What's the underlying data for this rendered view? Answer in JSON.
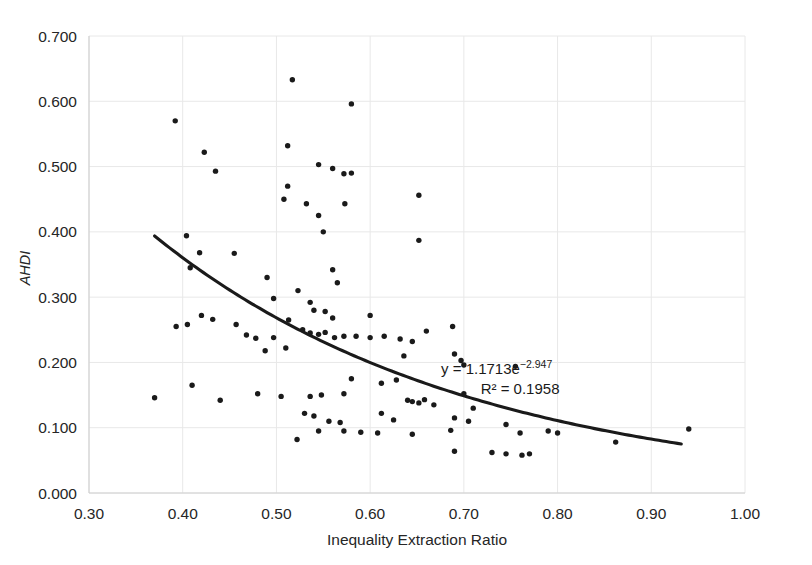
{
  "chart_data": {
    "type": "scatter",
    "title": "",
    "xlabel": "Inequality Extraction Ratio",
    "ylabel": "AHDI",
    "xlim": [
      0.3,
      1.0
    ],
    "ylim": [
      0.0,
      0.7
    ],
    "xticks": [
      "0.30",
      "0.40",
      "0.50",
      "0.60",
      "0.70",
      "0.80",
      "0.90",
      "1.00"
    ],
    "xtick_values": [
      0.3,
      0.4,
      0.5,
      0.6,
      0.7,
      0.8,
      0.9,
      1.0
    ],
    "yticks": [
      "0.000",
      "0.100",
      "0.200",
      "0.300",
      "0.400",
      "0.500",
      "0.600",
      "0.700"
    ],
    "ytick_values": [
      0.0,
      0.1,
      0.2,
      0.3,
      0.4,
      0.5,
      0.6,
      0.7
    ],
    "grid": true,
    "legend": "none",
    "marker": "filled-circle",
    "marker_color": "#1a1a1a",
    "marker_size": 5,
    "annotations": [
      {
        "text": "y = 1.1713e",
        "superscript": "−2.947",
        "x": 0.735,
        "y": 0.182
      },
      {
        "text": "R² = 0.1958",
        "superscript": "",
        "x": 0.76,
        "y": 0.152
      }
    ],
    "trendline": {
      "type": "exponential",
      "equation": "y = 1.1713e^(-2.947x)",
      "r_squared": 0.1958,
      "coefficient": 1.1713,
      "exponent": -2.947,
      "x_start": 0.37,
      "x_end": 0.932,
      "color": "#1a1a1a"
    },
    "points": [
      [
        0.392,
        0.57
      ],
      [
        0.517,
        0.633
      ],
      [
        0.58,
        0.596
      ],
      [
        0.423,
        0.522
      ],
      [
        0.435,
        0.493
      ],
      [
        0.512,
        0.532
      ],
      [
        0.545,
        0.503
      ],
      [
        0.56,
        0.497
      ],
      [
        0.572,
        0.489
      ],
      [
        0.58,
        0.49
      ],
      [
        0.512,
        0.47
      ],
      [
        0.508,
        0.45
      ],
      [
        0.532,
        0.443
      ],
      [
        0.573,
        0.443
      ],
      [
        0.545,
        0.425
      ],
      [
        0.652,
        0.456
      ],
      [
        0.55,
        0.4
      ],
      [
        0.652,
        0.387
      ],
      [
        0.404,
        0.394
      ],
      [
        0.418,
        0.368
      ],
      [
        0.455,
        0.367
      ],
      [
        0.408,
        0.345
      ],
      [
        0.56,
        0.342
      ],
      [
        0.565,
        0.322
      ],
      [
        0.49,
        0.33
      ],
      [
        0.523,
        0.31
      ],
      [
        0.497,
        0.298
      ],
      [
        0.536,
        0.292
      ],
      [
        0.54,
        0.28
      ],
      [
        0.552,
        0.278
      ],
      [
        0.56,
        0.268
      ],
      [
        0.6,
        0.272
      ],
      [
        0.393,
        0.255
      ],
      [
        0.405,
        0.258
      ],
      [
        0.42,
        0.272
      ],
      [
        0.432,
        0.266
      ],
      [
        0.457,
        0.258
      ],
      [
        0.468,
        0.242
      ],
      [
        0.478,
        0.237
      ],
      [
        0.497,
        0.238
      ],
      [
        0.513,
        0.265
      ],
      [
        0.528,
        0.25
      ],
      [
        0.536,
        0.245
      ],
      [
        0.545,
        0.243
      ],
      [
        0.552,
        0.246
      ],
      [
        0.562,
        0.238
      ],
      [
        0.572,
        0.24
      ],
      [
        0.585,
        0.24
      ],
      [
        0.6,
        0.238
      ],
      [
        0.615,
        0.24
      ],
      [
        0.632,
        0.236
      ],
      [
        0.645,
        0.232
      ],
      [
        0.66,
        0.248
      ],
      [
        0.688,
        0.255
      ],
      [
        0.51,
        0.222
      ],
      [
        0.488,
        0.218
      ],
      [
        0.636,
        0.21
      ],
      [
        0.69,
        0.213
      ],
      [
        0.697,
        0.203
      ],
      [
        0.7,
        0.196
      ],
      [
        0.755,
        0.194
      ],
      [
        0.41,
        0.165
      ],
      [
        0.37,
        0.146
      ],
      [
        0.44,
        0.142
      ],
      [
        0.48,
        0.152
      ],
      [
        0.505,
        0.148
      ],
      [
        0.536,
        0.148
      ],
      [
        0.548,
        0.15
      ],
      [
        0.572,
        0.152
      ],
      [
        0.58,
        0.175
      ],
      [
        0.612,
        0.168
      ],
      [
        0.628,
        0.173
      ],
      [
        0.64,
        0.142
      ],
      [
        0.645,
        0.14
      ],
      [
        0.652,
        0.138
      ],
      [
        0.658,
        0.143
      ],
      [
        0.668,
        0.135
      ],
      [
        0.7,
        0.152
      ],
      [
        0.71,
        0.13
      ],
      [
        0.53,
        0.122
      ],
      [
        0.54,
        0.118
      ],
      [
        0.556,
        0.11
      ],
      [
        0.568,
        0.108
      ],
      [
        0.612,
        0.122
      ],
      [
        0.625,
        0.112
      ],
      [
        0.69,
        0.115
      ],
      [
        0.705,
        0.11
      ],
      [
        0.745,
        0.105
      ],
      [
        0.76,
        0.092
      ],
      [
        0.79,
        0.095
      ],
      [
        0.8,
        0.092
      ],
      [
        0.862,
        0.078
      ],
      [
        0.94,
        0.098
      ],
      [
        0.522,
        0.082
      ],
      [
        0.545,
        0.095
      ],
      [
        0.572,
        0.095
      ],
      [
        0.59,
        0.093
      ],
      [
        0.608,
        0.092
      ],
      [
        0.645,
        0.09
      ],
      [
        0.686,
        0.096
      ],
      [
        0.69,
        0.064
      ],
      [
        0.73,
        0.062
      ],
      [
        0.745,
        0.06
      ],
      [
        0.762,
        0.058
      ],
      [
        0.77,
        0.06
      ]
    ]
  }
}
